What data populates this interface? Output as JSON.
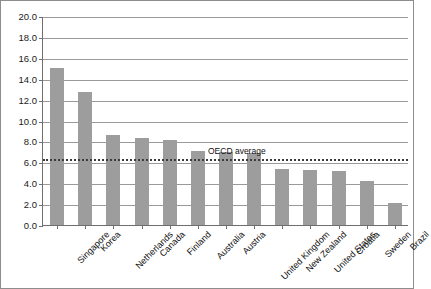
{
  "chart_data": {
    "type": "bar",
    "title": "",
    "xlabel": "",
    "ylabel": "",
    "ylim": [
      0.0,
      20.0
    ],
    "ytick_step": 2.0,
    "grid": true,
    "legend_position": "none",
    "bar_color": "#9d9d9d",
    "categories": [
      "Singapore",
      "Korea",
      "Netherlands",
      "Canada",
      "Finland",
      "Australia",
      "Austria",
      "United Kingdom",
      "New Zealand",
      "United States",
      "Croatia",
      "Sweden",
      "Brazil"
    ],
    "values": [
      15.0,
      12.7,
      8.6,
      8.3,
      8.1,
      7.1,
      7.0,
      6.9,
      5.4,
      5.3,
      5.2,
      4.2,
      2.1
    ],
    "ytick_labels": [
      "20.0",
      "18.0",
      "16.0",
      "14.0",
      "12.0",
      "10.0",
      "8.0",
      "6.0",
      "4.0",
      "2.0",
      "0.0"
    ],
    "ytick_values": [
      20.0,
      18.0,
      16.0,
      14.0,
      12.0,
      10.0,
      8.0,
      6.0,
      4.0,
      2.0,
      0.0
    ],
    "annotations": [
      {
        "name": "oecd-average",
        "label": "OECD average",
        "value": 6.4,
        "style": "dotted-horizontal-line",
        "color": "#3b3b3b"
      }
    ]
  }
}
